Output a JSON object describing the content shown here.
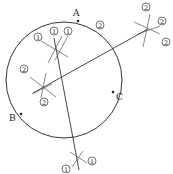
{
  "diagram": {
    "points": [
      {
        "label": "A",
        "x": 78,
        "y": 21,
        "lx": 73,
        "ly": 16
      },
      {
        "label": "B",
        "x": 21,
        "y": 114,
        "lx": 9,
        "ly": 121
      },
      {
        "label": "C",
        "x": 113,
        "y": 92,
        "lx": 116,
        "ly": 100
      }
    ],
    "circle": {
      "cx": 64,
      "cy": 80,
      "r": 58
    },
    "lines": [
      {
        "name": "bisector-1",
        "x1": 54,
        "y1": 38,
        "x2": 79,
        "y2": 170
      },
      {
        "name": "bisector-2",
        "x1": 33,
        "y1": 93,
        "x2": 148,
        "y2": 29
      }
    ],
    "marks": [
      {
        "name": "arc-cross-1",
        "x": 56,
        "y": 48,
        "label": "①"
      },
      {
        "name": "arc-cross-2",
        "x": 43,
        "y": 87,
        "label": "②"
      },
      {
        "name": "arc-cross-3",
        "x": 146,
        "y": 29,
        "label": "②"
      },
      {
        "name": "arc-cross-4",
        "x": 77,
        "y": 160,
        "label": "①"
      }
    ],
    "circled_labels": [
      {
        "text": "①",
        "x": 38,
        "y": 39
      },
      {
        "text": "①",
        "x": 54,
        "y": 33
      },
      {
        "text": "①",
        "x": 68,
        "y": 33
      },
      {
        "text": "②",
        "x": 24,
        "y": 71
      },
      {
        "text": "②",
        "x": 100,
        "y": 27
      },
      {
        "text": "②",
        "x": 145,
        "y": 8
      },
      {
        "text": "②",
        "x": 162,
        "y": 22
      },
      {
        "text": "②",
        "x": 166,
        "y": 43
      },
      {
        "text": "①",
        "x": 64,
        "y": 169
      },
      {
        "text": "①",
        "x": 92,
        "y": 162
      },
      {
        "text": "②",
        "x": 44,
        "y": 104
      }
    ]
  }
}
